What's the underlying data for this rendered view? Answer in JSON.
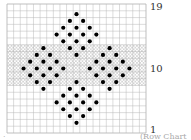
{
  "chart_data": {
    "type": "heatmap",
    "title": "",
    "grid": {
      "columns": 21,
      "rows": 19,
      "row_numbering": "bottom-to-top",
      "row_labels": [
        {
          "row": 19,
          "label": "19"
        },
        {
          "row": 10,
          "label": "10"
        },
        {
          "row": 1,
          "label": "1"
        }
      ]
    },
    "shaded_band": {
      "from_row": 8,
      "to_row": 13,
      "pattern": "crosshatch"
    },
    "dots": [
      {
        "row": 18,
        "cols": [
          11
        ]
      },
      {
        "row": 17,
        "cols": [
          10,
          12
        ]
      },
      {
        "row": 16,
        "cols": [
          9,
          11,
          13
        ]
      },
      {
        "row": 15,
        "cols": [
          8,
          10,
          12,
          14
        ]
      },
      {
        "row": 14,
        "cols": [
          9,
          11,
          13
        ]
      },
      {
        "row": 13,
        "cols": [
          6,
          10,
          12,
          16
        ]
      },
      {
        "row": 12,
        "cols": [
          5,
          7,
          11,
          15,
          17
        ]
      },
      {
        "row": 11,
        "cols": [
          4,
          6,
          8,
          14,
          16,
          18
        ]
      },
      {
        "row": 10,
        "cols": [
          3,
          5,
          7,
          9,
          13,
          15,
          17,
          19
        ]
      },
      {
        "row": 9,
        "cols": [
          4,
          6,
          8,
          14,
          16,
          18
        ]
      },
      {
        "row": 8,
        "cols": [
          5,
          7,
          11,
          15,
          17
        ]
      },
      {
        "row": 7,
        "cols": [
          6,
          10,
          12,
          16
        ]
      },
      {
        "row": 6,
        "cols": [
          9,
          11,
          13
        ]
      },
      {
        "row": 5,
        "cols": [
          8,
          10,
          12,
          14
        ]
      },
      {
        "row": 4,
        "cols": [
          9,
          11,
          13
        ]
      },
      {
        "row": 3,
        "cols": [
          10,
          12
        ]
      },
      {
        "row": 2,
        "cols": [
          11
        ]
      }
    ],
    "colors": {
      "grid": "#b8b8b8",
      "dot": "#000000",
      "hatch": "#c4c4c4"
    }
  },
  "caption": "(Row Chart",
  "corner_mark": "·"
}
